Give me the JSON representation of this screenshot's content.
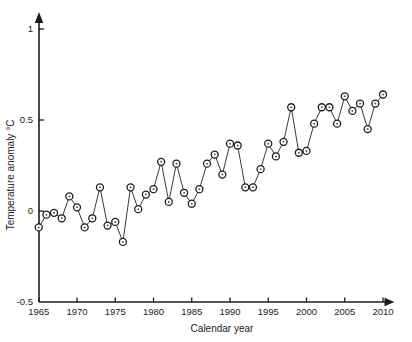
{
  "chart_data": {
    "type": "line",
    "title": "",
    "xlabel": "Calendar year",
    "ylabel": "Temperature anomaly °C",
    "xlim": [
      1964.3,
      2011.5
    ],
    "ylim": [
      -0.5,
      1.0
    ],
    "xticks": [
      1965,
      1970,
      1975,
      1980,
      1985,
      1990,
      1995,
      2000,
      2005,
      2010
    ],
    "xticklabels": [
      "1965",
      "1970",
      "1975",
      "1980",
      "1985",
      "1990",
      "1995",
      "2000",
      "2005",
      "2010"
    ],
    "yticks": [
      -0.5,
      0,
      0.5,
      1
    ],
    "yticklabels": [
      "-0.5",
      "0",
      "0.5",
      "1"
    ],
    "grid": false,
    "legend": null,
    "marker": "circle-open-with-dot",
    "line_color": "#3a3a3a",
    "marker_edge_color": "#1b1b1b",
    "marker_face_color": "#ffffff",
    "axis_color": "#1b1b1b",
    "x": [
      1965,
      1966,
      1967,
      1968,
      1969,
      1970,
      1971,
      1972,
      1973,
      1974,
      1975,
      1976,
      1977,
      1978,
      1979,
      1980,
      1981,
      1982,
      1983,
      1984,
      1985,
      1986,
      1987,
      1988,
      1989,
      1990,
      1991,
      1992,
      1993,
      1994,
      1995,
      1996,
      1997,
      1998,
      1999,
      2000,
      2001,
      2002,
      2003,
      2004,
      2005,
      2006,
      2007,
      2008,
      2009,
      2010
    ],
    "values": [
      -0.09,
      -0.02,
      -0.01,
      -0.04,
      0.08,
      0.02,
      -0.09,
      -0.04,
      0.13,
      -0.08,
      -0.06,
      -0.17,
      0.13,
      0.01,
      0.09,
      0.12,
      0.27,
      0.05,
      0.26,
      0.1,
      0.04,
      0.12,
      0.26,
      0.31,
      0.2,
      0.37,
      0.36,
      0.13,
      0.13,
      0.23,
      0.37,
      0.3,
      0.38,
      0.57,
      0.32,
      0.33,
      0.48,
      0.57,
      0.57,
      0.48,
      0.63,
      0.55,
      0.59,
      0.45,
      0.59,
      0.64
    ]
  },
  "labels": {
    "y_axis_title": "Temperature anomaly °C",
    "x_axis_title": "Calendar year"
  }
}
